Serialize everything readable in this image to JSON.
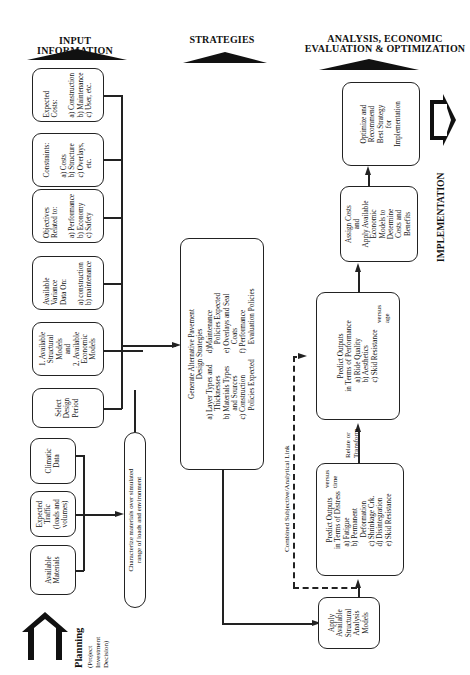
{
  "headers": {
    "input": "INPUT  INFORMATION",
    "strategies": "STRATEGIES",
    "analysis_line1": "ANALYSIS, ECONOMIC",
    "analysis_line2": "EVALUATION & OPTIMIZATION"
  },
  "input_boxes": {
    "expected_costs": "Expected\nCosts:\n\na) Construction\nb) Maintenance\nc) User, etc.",
    "constraints": "Constraints:\n\na) Costs\nb) Structure\nc) Overlays,\n     etc.",
    "objectives": "Objectives\nRelated to:\n\na) Performance\nb) Economy\nc) Safety",
    "variance": "Available\nVariance\nData On:\n\na) construction\nb) maintenance",
    "models": "1. Available\nStructural\nModels\nand\n2. Available\nEconomic\nModels",
    "design_period": "Select\nDesign\nPeriod",
    "climatic": "Climatic\nData",
    "traffic": "Expected\nTraffic\n(loads and\nvolumes)",
    "materials": "Available\nMaterials"
  },
  "characterize_box": "Characterize materials over simulated\nrange of loads and environment",
  "strategies_box": {
    "title": "Generate Alternative Pavement\nDesign Strategies",
    "col1": "a) Layer Types and\n     Thicknesses\nb) Materials Types\n     and Sources\nc) Construction\n     Policies Expected",
    "col2": "d)Maintenance\n     Policies Expected\ne) Overlays and Seal\n     Coats\nf) Performance\n     Evaluation Policies"
  },
  "analysis_boxes": {
    "apply_structural": "Apply\nAvailable\nStructural\nAnalysis\nModels",
    "distress_title": "Predict Outputs\nin Terms of Distress",
    "distress_items": "a) Fatigue\nb) Permanent\n     Deformation\nc) Shrinkage Crk.\nd) Disintegration\ne) Skid Resistance",
    "distress_versus": "versus\ntime",
    "performance_title": "Predict Outputs\nin Terms of Performance",
    "performance_items": "a) Ride Quality\nb) Aesthetics\nc) Skid Resistance",
    "performance_versus": "versus\nage",
    "assign_costs": "Assign Costs\nand\nApply Available\nEconomic\nModels to\nDetermine\nCosts and\nBenefits",
    "optimize": "Optimize and\nRecommend\nBest Strategy\nfor\nImplementation"
  },
  "link_labels": {
    "relate": "Relate or\nTransform",
    "combined": "Combined Subjective/Analytical Link"
  },
  "planning": {
    "title": "Planning",
    "subtitle": "(Project\nInvestment\nDecision)"
  },
  "implementation": "IMPLEMENTATION"
}
